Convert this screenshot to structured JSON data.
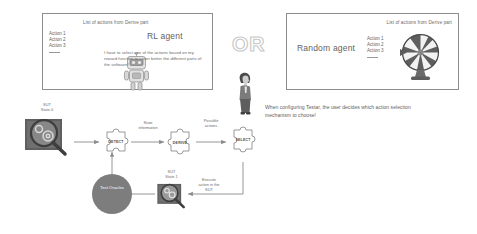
{
  "rl_panel": {
    "title": "RL agent",
    "list_caption": "List of actions from Derive part",
    "actions": [
      "Action 1",
      "Action 2",
      "Action 3"
    ],
    "speech": "I have to select one of the actions based on my reward function to cover better the different parts of the software!",
    "robot_icon": "robot-icon"
  },
  "random_panel": {
    "title": "Random agent",
    "list_caption": "List of actions from Derive part",
    "actions": [
      "Action 1",
      "Action 2",
      "Action 3"
    ],
    "wheel_icon": "wheel-of-fortune-icon"
  },
  "divider": {
    "or_label": "OR",
    "person_icon": "person-icon"
  },
  "caption": "When configuring Testar, the user decides which action selection mechanism to choose!",
  "flow": {
    "sut_state_0_label": "SUT\nState 0",
    "sut_state_1_label": "SUT\nState 1",
    "sut_state_0_icon": "magnifier-over-gears-icon",
    "sut_state_1_icon": "magnifier-over-gears-icon",
    "steps": [
      {
        "name": "detect",
        "label": "DETECT"
      },
      {
        "name": "derive",
        "label": "DERIVE"
      },
      {
        "name": "select",
        "label": "SELECT"
      }
    ],
    "edges": [
      {
        "name": "state-information",
        "label": "State\ninformation"
      },
      {
        "name": "possible-actions",
        "label": "Possible\nactions"
      },
      {
        "name": "execute-action",
        "label": "Execute\naction in the\nSUT"
      }
    ],
    "oracle_label": "Test\nOracles"
  },
  "colors": {
    "panel_border": "#8d8d8d",
    "text": "#6b6b6b",
    "or_outline": "#c9c9c9",
    "oracle_fill": "#7d7d7d",
    "arrow": "#8a8a8a",
    "puzzle_stroke": "#707070"
  }
}
